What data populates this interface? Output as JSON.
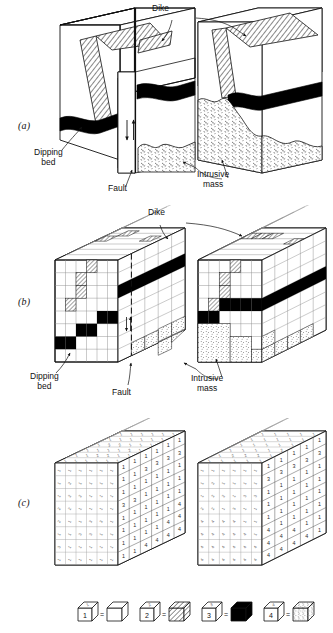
{
  "figure": {
    "panels": [
      {
        "id": "a",
        "label": "(a)",
        "caption": "Geologic block diagrams with continuous structures"
      },
      {
        "id": "b",
        "label": "(b)",
        "caption": "Same blocks discretized into cubic cells"
      },
      {
        "id": "c",
        "label": "(c)",
        "caption": "Cells replaced by rock-type code numbers"
      }
    ],
    "annotations": {
      "dike": "Dike",
      "dipping_bed": "Dipping\nbed",
      "fault": "Fault",
      "intrusive_mass": "Intrusive\nmass"
    },
    "legend": {
      "title": "",
      "pairs": [
        {
          "code": "1",
          "code_top": "1",
          "pattern": "blank",
          "meaning": "country rock"
        },
        {
          "code": "2",
          "code_top": "2",
          "pattern": "hatched",
          "meaning": "dike"
        },
        {
          "code": "3",
          "code_top": "3",
          "pattern": "solid-black",
          "meaning": "dipping bed"
        },
        {
          "code": "4",
          "code_top": "4",
          "pattern": "stippled",
          "meaning": "intrusive mass"
        }
      ],
      "equals": "="
    },
    "colors": {
      "ink": "#111111",
      "line": "#222222",
      "grid": "#888888",
      "grid_light": "#b4b4b4",
      "solid_bed": "#000000",
      "paper": "#ffffff"
    }
  },
  "chart_data": {
    "type": "table",
    "codes": {
      "1": "country rock",
      "2": "dike",
      "3": "dipping bed",
      "4": "intrusive mass"
    },
    "left_block_front": {
      "rows": 8,
      "cols": 6,
      "values": [
        [
          "1",
          "1",
          "1",
          "1",
          "1",
          "1"
        ],
        [
          "1",
          "1",
          "3",
          "3",
          "3",
          "3"
        ],
        [
          "1",
          "1",
          "1",
          "1",
          "1",
          "1"
        ],
        [
          "3",
          "3",
          "1",
          "1",
          "1",
          "1"
        ],
        [
          "1",
          "1",
          "1",
          "1",
          "1",
          "1"
        ],
        [
          "1",
          "1",
          "1",
          "1",
          "1",
          "4"
        ],
        [
          "1",
          "1",
          "1",
          "1",
          "4",
          "4"
        ],
        [
          "1",
          "1",
          "4",
          "4",
          "4",
          "4"
        ]
      ]
    },
    "right_block_front": {
      "rows": 8,
      "cols": 5,
      "values": [
        [
          "1",
          "1",
          "1",
          "1",
          "1"
        ],
        [
          "3",
          "3",
          "3",
          "3",
          "3"
        ],
        [
          "1",
          "1",
          "1",
          "1",
          "1"
        ],
        [
          "1",
          "1",
          "1",
          "1",
          "1"
        ],
        [
          "1",
          "1",
          "1",
          "1",
          "1"
        ],
        [
          "4",
          "1",
          "1",
          "1",
          "1"
        ],
        [
          "4",
          "4",
          "4",
          "1",
          "1"
        ],
        [
          "4",
          "4",
          "4",
          "4",
          "1"
        ]
      ]
    },
    "left_block_top": {
      "rows": 6,
      "cols": 6,
      "values": [
        [
          "1",
          "1",
          "1",
          "1",
          "1",
          "1"
        ],
        [
          "1",
          "1",
          "2",
          "2",
          "1",
          "1"
        ],
        [
          "1",
          "1",
          "1",
          "1",
          "2",
          "1"
        ],
        [
          "1",
          "2",
          "2",
          "1",
          "1",
          "1"
        ],
        [
          "1",
          "1",
          "1",
          "1",
          "1",
          "1"
        ],
        [
          "1",
          "1",
          "1",
          "1",
          "1",
          "1"
        ]
      ]
    },
    "right_block_top": {
      "rows": 6,
      "cols": 5,
      "values": [
        [
          "1",
          "1",
          "1",
          "1",
          "1"
        ],
        [
          "1",
          "2",
          "2",
          "2",
          "1"
        ],
        [
          "1",
          "1",
          "1",
          "1",
          "2"
        ],
        [
          "1",
          "1",
          "1",
          "1",
          "1"
        ],
        [
          "1",
          "1",
          "1",
          "1",
          "1"
        ],
        [
          "1",
          "1",
          "1",
          "1",
          "1"
        ]
      ]
    },
    "left_block_side": {
      "rows": 8,
      "cols": 6,
      "values": [
        [
          "1",
          "1",
          "1",
          "1",
          "1",
          "1"
        ],
        [
          "1",
          "2",
          "1",
          "1",
          "1",
          "1"
        ],
        [
          "1",
          "2",
          "2",
          "1",
          "1",
          "1"
        ],
        [
          "2",
          "2",
          "1",
          "1",
          "1",
          "1"
        ],
        [
          "2",
          "1",
          "1",
          "3",
          "3",
          "1"
        ],
        [
          "1",
          "1",
          "3",
          "3",
          "1",
          "1"
        ],
        [
          "3",
          "1",
          "1",
          "1",
          "1",
          "1"
        ],
        [
          "1",
          "1",
          "1",
          "1",
          "1",
          "1"
        ]
      ]
    },
    "right_block_side": {
      "rows": 8,
      "cols": 6,
      "values": [
        [
          "1",
          "1",
          "1",
          "1",
          "1",
          "1"
        ],
        [
          "1",
          "2",
          "1",
          "1",
          "1",
          "1"
        ],
        [
          "1",
          "2",
          "2",
          "1",
          "3",
          "3"
        ],
        [
          "2",
          "2",
          "1",
          "3",
          "1",
          "1"
        ],
        [
          "4",
          "4",
          "4",
          "4",
          "1",
          "1"
        ],
        [
          "4",
          "4",
          "4",
          "4",
          "4",
          "1"
        ],
        [
          "4",
          "4",
          "4",
          "4",
          "4",
          "4"
        ],
        [
          "4",
          "4",
          "4",
          "4",
          "4",
          "4"
        ]
      ]
    }
  }
}
